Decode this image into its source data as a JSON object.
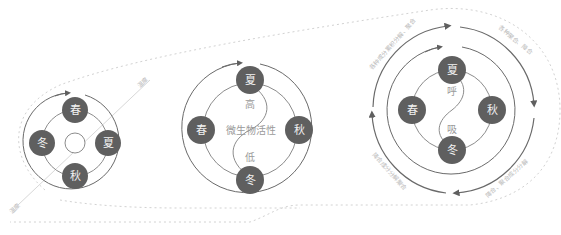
{
  "colors": {
    "season_fill": "#5f5f5f",
    "ring_stroke": "#6a6a6a",
    "inner_ring_stroke": "#8c8c8c",
    "dotted_outline": "#cfcfcf",
    "label_faint": "#b8b8b8",
    "mid_text": "#9a9a9a"
  },
  "diagram1": {
    "seasons": {
      "top": "春",
      "right": "夏",
      "bottom": "秋",
      "left": "冬"
    },
    "axis_label_top": "温度",
    "axis_label_bottom": "温度"
  },
  "diagram2": {
    "seasons": {
      "top": "夏",
      "right": "秋",
      "bottom": "冬",
      "left": "春"
    },
    "center_label": "微生物活性",
    "high_label": "高",
    "low_label": "低"
  },
  "diagram3": {
    "seasons": {
      "top": "夏",
      "right": "秋",
      "bottom": "冬",
      "left": "春"
    },
    "exhale_label": "呼",
    "inhale_label": "吸",
    "arc_label_top_left": "各种成分累积分解、聚合",
    "arc_label_top_right": "各种聚合、降合",
    "arc_label_bottom_left": "降合成分分解聚合",
    "arc_label_bottom_right": "降合、聚合成分分解"
  }
}
